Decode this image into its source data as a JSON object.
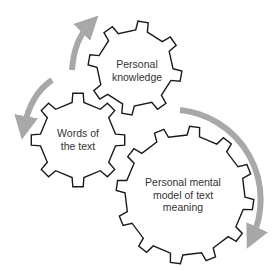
{
  "diagram": {
    "type": "interlocking-gears-cycle",
    "colors": {
      "background": "#ffffff",
      "gear_stroke": "#1a1a1a",
      "gear_fill": "#ffffff",
      "arrow": "#a8a8a8",
      "text": "#333333"
    },
    "gears": [
      {
        "id": "personal-knowledge",
        "lines": [
          "Personal",
          "knowledge"
        ],
        "cx": 135,
        "cy": 68,
        "r": 38,
        "tooth": 9,
        "teeth": 8,
        "rotation": 10
      },
      {
        "id": "words-of-the-text",
        "lines": [
          "Words of",
          "the text"
        ],
        "cx": 78,
        "cy": 140,
        "r": 38,
        "tooth": 9,
        "teeth": 8,
        "rotation": 0
      },
      {
        "id": "personal-mental-model",
        "lines": [
          "Personal mental",
          "model of text",
          "meaning"
        ],
        "cx": 185,
        "cy": 195,
        "r": 60,
        "tooth": 9,
        "teeth": 12,
        "rotation": 8
      }
    ],
    "arrows": [
      {
        "id": "arrow-left-to-top",
        "from": "words-of-the-text",
        "to": "personal-knowledge",
        "direction": "up"
      },
      {
        "id": "arrow-top-to-left",
        "from": "personal-knowledge",
        "to": "words-of-the-text",
        "direction": "down-left"
      },
      {
        "id": "arrow-big-clockwise",
        "from": "personal-knowledge",
        "to": "personal-mental-model",
        "direction": "clockwise-down"
      }
    ]
  }
}
